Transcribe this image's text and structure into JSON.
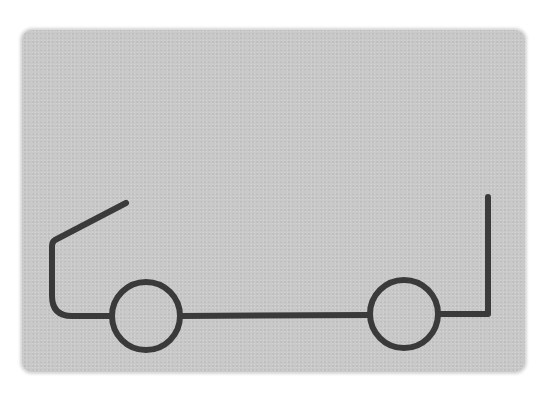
{
  "figure": {
    "colors": {
      "card": "#c9c9c9",
      "stroke": "#3a3a3a",
      "background": "#ffffff"
    },
    "stroke_width": 6,
    "front_wheel": {
      "cx": 146,
      "cy": 316,
      "r": 34
    },
    "rear_wheel": {
      "cx": 404,
      "cy": 314,
      "r": 34
    },
    "body_path_front": "M126,203 L55,240 Q52,242 52,246 L52,296 Q52,316 72,316 L112,316",
    "chassis_path": "M180,316 L370,315",
    "body_path_rear": "M438,314 L488,314 L488,197"
  }
}
